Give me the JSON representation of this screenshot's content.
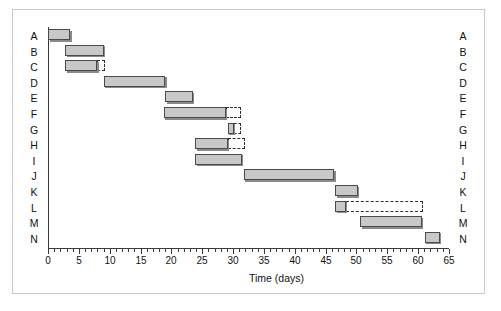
{
  "chart": {
    "type": "gantt",
    "title": "",
    "xlabel": "Time (days)",
    "ylabel": "",
    "xlim": [
      0,
      65
    ],
    "xtick_step": 5,
    "xminor_step": 1,
    "xticks": [
      0,
      5,
      10,
      15,
      20,
      25,
      30,
      35,
      40,
      45,
      50,
      55,
      60,
      65
    ],
    "xticklabels": [
      "0",
      "5",
      "10",
      "15",
      "20",
      "25",
      "30",
      "35",
      "40",
      "45",
      "50",
      "55",
      "60",
      "65"
    ],
    "grid": false,
    "legend": null,
    "categories": [
      "A",
      "B",
      "C",
      "D",
      "E",
      "F",
      "G",
      "H",
      "I",
      "J",
      "K",
      "L",
      "M",
      "N"
    ],
    "left_axis_labels": [
      "A",
      "B",
      "C",
      "D",
      "E",
      "F",
      "G",
      "H",
      "I",
      "J",
      "K",
      "L",
      "M",
      "N"
    ],
    "right_axis_labels": [
      "A",
      "B",
      "C",
      "D",
      "E",
      "F",
      "G",
      "H",
      "I",
      "J",
      "K",
      "L",
      "M",
      "N"
    ],
    "bar_fill_color": "#c8c8c8",
    "bar_edge_color": "#4a4a4a",
    "float_edge_color": "#2f2f2f",
    "tasks": [
      {
        "id": "A",
        "label": "A",
        "start": 0.0,
        "end": 3.6,
        "duration": 3.6,
        "float_start": null,
        "float_end": null,
        "float": 0.0
      },
      {
        "id": "B",
        "label": "B",
        "start": 2.8,
        "end": 9.0,
        "duration": 6.2,
        "float_start": null,
        "float_end": null,
        "float": 0.0
      },
      {
        "id": "C",
        "label": "C",
        "start": 2.8,
        "end": 8.0,
        "duration": 5.2,
        "float_start": 8.0,
        "float_end": 9.2,
        "float": 1.2
      },
      {
        "id": "D",
        "label": "D",
        "start": 9.0,
        "end": 19.0,
        "duration": 10.0,
        "float_start": null,
        "float_end": null,
        "float": 0.0
      },
      {
        "id": "E",
        "label": "E",
        "start": 19.0,
        "end": 23.5,
        "duration": 4.5,
        "float_start": null,
        "float_end": null,
        "float": 0.0
      },
      {
        "id": "F",
        "label": "F",
        "start": 18.8,
        "end": 28.8,
        "duration": 10.0,
        "float_start": 28.8,
        "float_end": 31.3,
        "float": 2.5
      },
      {
        "id": "G",
        "label": "G",
        "start": 29.1,
        "end": 30.1,
        "duration": 1.0,
        "float_start": 30.1,
        "float_end": 31.3,
        "float": 1.2
      },
      {
        "id": "H",
        "label": "H",
        "start": 23.9,
        "end": 29.1,
        "duration": 5.2,
        "float_start": 29.1,
        "float_end": 32.0,
        "float": 2.9
      },
      {
        "id": "I",
        "label": "I",
        "start": 23.9,
        "end": 31.4,
        "duration": 7.5,
        "float_start": null,
        "float_end": null,
        "float": 0.0
      },
      {
        "id": "J",
        "label": "J",
        "start": 31.7,
        "end": 46.4,
        "duration": 14.7,
        "float_start": null,
        "float_end": null,
        "float": 0.0
      },
      {
        "id": "K",
        "label": "K",
        "start": 46.6,
        "end": 50.2,
        "duration": 3.6,
        "float_start": null,
        "float_end": null,
        "float": 0.0
      },
      {
        "id": "L",
        "label": "L",
        "start": 46.6,
        "end": 48.3,
        "duration": 1.7,
        "float_start": 48.3,
        "float_end": 60.8,
        "float": 12.5
      },
      {
        "id": "M",
        "label": "M",
        "start": 50.6,
        "end": 60.6,
        "duration": 10.0,
        "float_start": null,
        "float_end": null,
        "float": 0.0
      },
      {
        "id": "N",
        "label": "N",
        "start": 61.1,
        "end": 63.5,
        "duration": 2.4,
        "float_start": null,
        "float_end": null,
        "float": 0.0
      }
    ]
  }
}
